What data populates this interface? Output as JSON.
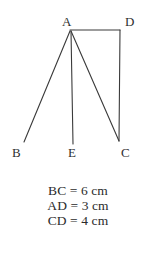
{
  "figure": {
    "stroke_color": "#3a3a3a",
    "background_color": "#ffffff",
    "stroke_width": 1.1,
    "vertices": [
      {
        "id": "A",
        "label": "A",
        "x": 70,
        "y": 30,
        "label_x": 62,
        "label_y": 15
      },
      {
        "id": "D",
        "label": "D",
        "x": 119,
        "y": 30,
        "label_x": 125,
        "label_y": 15
      },
      {
        "id": "B",
        "label": "B",
        "x": 24,
        "y": 142,
        "label_x": 12,
        "label_y": 146
      },
      {
        "id": "E",
        "label": "E",
        "x": 73,
        "y": 144,
        "label_x": 68,
        "label_y": 146
      },
      {
        "id": "C",
        "label": "C",
        "x": 119,
        "y": 141,
        "label_x": 121,
        "label_y": 146
      }
    ],
    "segments": [
      {
        "id": "AB",
        "from": "A",
        "to": "B",
        "x1": 70,
        "y1": 31,
        "x2": 24,
        "y2": 142
      },
      {
        "id": "AE",
        "from": "A",
        "to": "E",
        "x1": 71,
        "y1": 31,
        "x2": 73,
        "y2": 144
      },
      {
        "id": "AC",
        "from": "A",
        "to": "C",
        "x1": 71,
        "y1": 31,
        "x2": 119,
        "y2": 141
      },
      {
        "id": "AD",
        "from": "A",
        "to": "D",
        "x1": 70,
        "y1": 30,
        "x2": 120,
        "y2": 30
      },
      {
        "id": "DC",
        "from": "D",
        "to": "C",
        "x1": 120,
        "y1": 30,
        "x2": 119,
        "y2": 141
      }
    ]
  },
  "measurements": [
    {
      "id": "BC",
      "text": "BC = 6 cm",
      "segment": "BC",
      "value": 6,
      "unit": "cm"
    },
    {
      "id": "AD",
      "text": "AD = 3 cm",
      "segment": "AD",
      "value": 3,
      "unit": "cm"
    },
    {
      "id": "CD",
      "text": "CD = 4 cm",
      "segment": "CD",
      "value": 4,
      "unit": "cm"
    }
  ]
}
